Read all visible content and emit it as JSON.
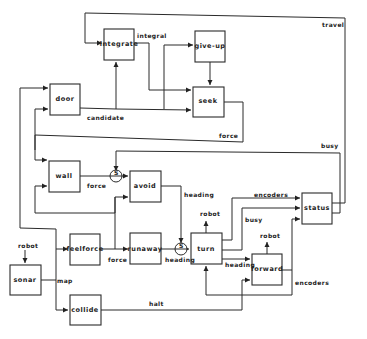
{
  "diagram": {
    "modules": {
      "integrate": "integrate",
      "give_up": "give-up",
      "seek": "seek",
      "door": "door",
      "wall": "wall",
      "avoid": "avoid",
      "feelforce": "feelforce",
      "runaway": "runaway",
      "sonar": "sonar",
      "collide": "collide",
      "turn": "turn",
      "forward": "forward",
      "status": "status"
    },
    "wire_labels": {
      "integral": "integral",
      "travel": "travel",
      "candidate": "candidate",
      "force_seek": "force",
      "busy_top": "busy",
      "force_wall": "force",
      "heading_avoid": "heading",
      "encoders_status": "encoders",
      "busy_turn": "busy",
      "robot_sonar": "robot",
      "robot_turn": "robot",
      "robot_forward": "robot",
      "force_feelforce": "force",
      "heading_runaway": "heading",
      "heading_turn": "heading",
      "map": "map",
      "encoders_forward": "encoders",
      "halt": "halt"
    },
    "nodes": {
      "suppress_wall": "S",
      "suppress_runaway": "S"
    }
  }
}
